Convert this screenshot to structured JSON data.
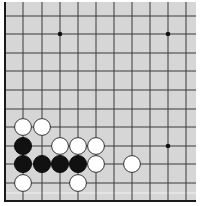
{
  "board": {
    "background": "#d6d6d6",
    "line_color": "#3a3a3a",
    "edge_color": "#1a1a1a",
    "columns_x": [
      5,
      23,
      42,
      60,
      78,
      96,
      114,
      132,
      150,
      168,
      186
    ],
    "rows_y": [
      16,
      34,
      53,
      71,
      90,
      109,
      127,
      146,
      164,
      183,
      201
    ],
    "visible_edges": [
      "left",
      "bottom"
    ],
    "star_points": [
      [
        3,
        1
      ],
      [
        9,
        1
      ],
      [
        9,
        7
      ]
    ],
    "stones": [
      {
        "color": "white",
        "col": 1,
        "row": 6
      },
      {
        "color": "white",
        "col": 2,
        "row": 6
      },
      {
        "color": "black",
        "col": 1,
        "row": 7
      },
      {
        "color": "white",
        "col": 3,
        "row": 7
      },
      {
        "color": "white",
        "col": 4,
        "row": 7
      },
      {
        "color": "white",
        "col": 5,
        "row": 7
      },
      {
        "color": "black",
        "col": 1,
        "row": 8
      },
      {
        "color": "black",
        "col": 2,
        "row": 8
      },
      {
        "color": "black",
        "col": 3,
        "row": 8
      },
      {
        "color": "black",
        "col": 4,
        "row": 8
      },
      {
        "color": "white",
        "col": 5,
        "row": 8
      },
      {
        "color": "white",
        "col": 7,
        "row": 8
      },
      {
        "color": "white",
        "col": 1,
        "row": 9
      },
      {
        "color": "white",
        "col": 4,
        "row": 9
      }
    ]
  }
}
